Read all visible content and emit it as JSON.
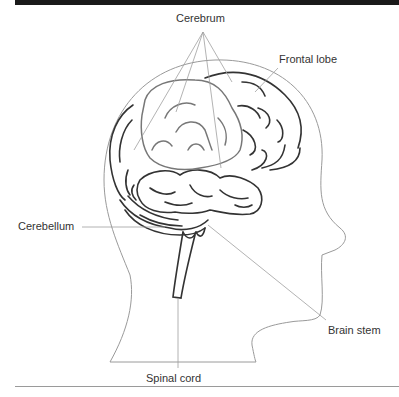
{
  "diagram": {
    "labels": {
      "cerebrum": "Cerebrum",
      "frontal_lobe": "Frontal lobe",
      "cerebellum": "Cerebellum",
      "brain_stem": "Brain stem",
      "spinal_cord": "Spinal cord"
    },
    "colors": {
      "top_bar": "#1a1a1a",
      "brain_outline": "#333333",
      "highlighted_region": "#777777",
      "leader_lines": "#a0a0a0",
      "head_outline": "#9a9a9a",
      "label_text": "#333333"
    }
  }
}
